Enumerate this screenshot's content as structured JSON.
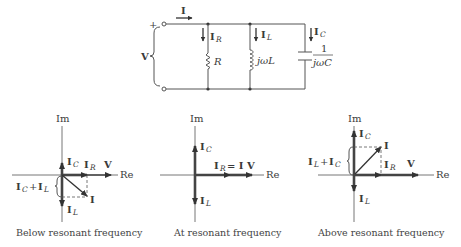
{
  "circuit": {
    "source_plus": "+",
    "source_label": "V",
    "total_current": "I",
    "branches": [
      {
        "current": "I",
        "current_sub": "R",
        "element": "R"
      },
      {
        "current": "I",
        "current_sub": "L",
        "element": "jωL"
      },
      {
        "current": "I",
        "current_sub": "C",
        "element_num": "1",
        "element_den": "jωC"
      }
    ]
  },
  "phasors": [
    {
      "caption": "Below resonant frequency",
      "axis_im": "Im",
      "axis_re": "Re",
      "labels": {
        "ic": "I",
        "ic_sub": "C",
        "ir": "I",
        "ir_sub": "R",
        "v": "V",
        "i": "I",
        "il": "I",
        "il_sub": "L",
        "sum_a": "I",
        "sum_a_sub": "C",
        "sum_plus": "+",
        "sum_b": "I",
        "sum_b_sub": "L"
      }
    },
    {
      "caption": "At resonant frequency",
      "axis_im": "Im",
      "axis_re": "Re",
      "labels": {
        "ic": "I",
        "ic_sub": "C",
        "ir": "I",
        "ir_sub": "R",
        "eq": "= I",
        "v": "V",
        "il": "I",
        "il_sub": "L"
      }
    },
    {
      "caption": "Above resonant frequency",
      "axis_im": "Im",
      "axis_re": "Re",
      "labels": {
        "ic": "I",
        "ic_sub": "C",
        "ir": "I",
        "ir_sub": "R",
        "v": "V",
        "i": "I",
        "il": "I",
        "il_sub": "L",
        "sum_a": "I",
        "sum_a_sub": "L",
        "sum_plus": "+",
        "sum_b": "I",
        "sum_b_sub": "C"
      }
    }
  ]
}
